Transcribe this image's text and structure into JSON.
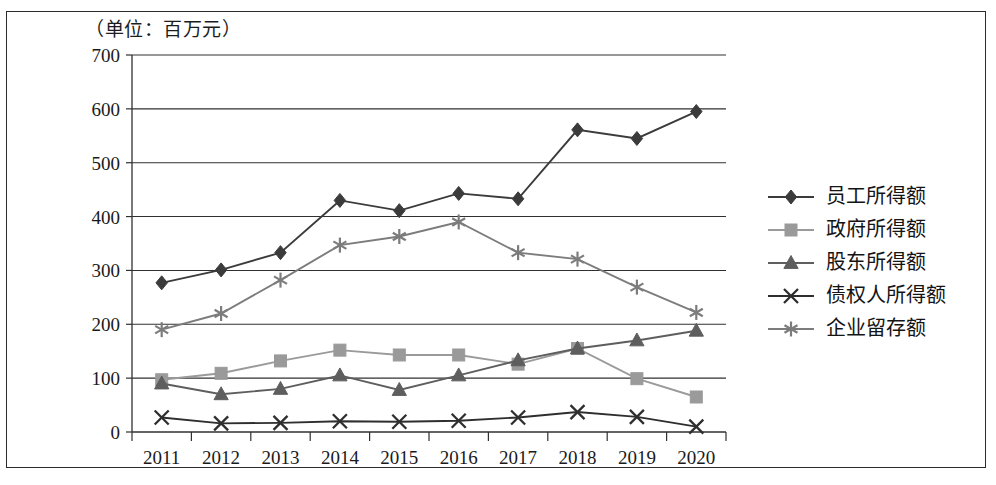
{
  "caption": "（单位：百万元）",
  "chart_data": {
    "type": "line",
    "title": "",
    "subtitle": "",
    "unit_note": "（单位：百万元）",
    "xlabel": "",
    "ylabel": "",
    "categories": [
      "2011",
      "2012",
      "2013",
      "2014",
      "2015",
      "2016",
      "2017",
      "2018",
      "2019",
      "2020"
    ],
    "x": [
      2011,
      2012,
      2013,
      2014,
      2015,
      2016,
      2017,
      2018,
      2019,
      2020
    ],
    "ylim": [
      0,
      700
    ],
    "ytick_labels": [
      "700",
      "600",
      "500",
      "400",
      "300",
      "200",
      "100",
      "0"
    ],
    "yticks": [
      700,
      600,
      500,
      400,
      300,
      200,
      100,
      0
    ],
    "grid": true,
    "legend_position": "right",
    "series": [
      {
        "name": "员工所得额",
        "marker": "diamond",
        "color": "#3b3b3b",
        "values": [
          277,
          301,
          333,
          430,
          411,
          443,
          433,
          561,
          545,
          595
        ]
      },
      {
        "name": "政府所得额",
        "marker": "square",
        "color": "#9a9a9a",
        "values": [
          97,
          109,
          132,
          152,
          143,
          143,
          126,
          155,
          99,
          65
        ]
      },
      {
        "name": "股东所得额",
        "marker": "triangle",
        "color": "#5e5e5e",
        "values": [
          90,
          70,
          80,
          105,
          78,
          105,
          133,
          155,
          170,
          188
        ]
      },
      {
        "name": "债权人所得额",
        "marker": "x",
        "color": "#2e2e2e",
        "values": [
          27,
          16,
          17,
          20,
          19,
          21,
          27,
          37,
          28,
          10
        ]
      },
      {
        "name": "企业留存额",
        "marker": "asterisk",
        "color": "#7c7c7c",
        "values": [
          190,
          220,
          282,
          347,
          363,
          390,
          333,
          321,
          269,
          222
        ]
      }
    ]
  },
  "legend": {
    "items": [
      {
        "label": "员工所得额",
        "marker": "diamond",
        "color": "#3b3b3b"
      },
      {
        "label": "政府所得额",
        "marker": "square",
        "color": "#9a9a9a"
      },
      {
        "label": "股东所得额",
        "marker": "triangle",
        "color": "#5e5e5e"
      },
      {
        "label": "债权人所得额",
        "marker": "x",
        "color": "#2e2e2e"
      },
      {
        "label": "企业留存额",
        "marker": "asterisk",
        "color": "#7c7c7c"
      }
    ]
  }
}
